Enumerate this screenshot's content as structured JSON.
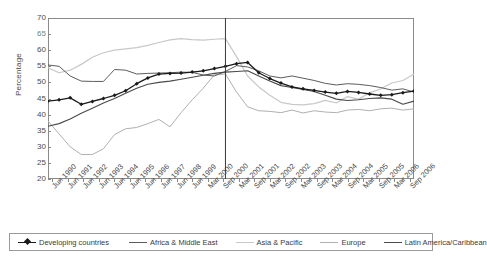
{
  "chart_data": {
    "type": "line",
    "title": "",
    "xlabel": "",
    "ylabel": "Percentage",
    "ylim": [
      20,
      70
    ],
    "ytick_step": 5,
    "yticks": [
      70,
      65,
      60,
      55,
      50,
      45,
      40,
      35,
      30,
      25,
      20
    ],
    "grid": false,
    "legend_position": "bottom",
    "annotations": [
      {
        "type": "vertical-line",
        "at": "Jun 1998",
        "label": ""
      }
    ],
    "categories": [
      "Jun 1990",
      "Dec 1990",
      "Jun 1991",
      "Dec 1991",
      "Jun 1992",
      "Dec 1992",
      "Jun 1993",
      "Dec 1993",
      "Jun 1994",
      "Dec 1994",
      "Jun 1995",
      "Dec 1995",
      "Jun 1996",
      "Dec 1996",
      "Jun 1997",
      "Dec 1997",
      "Jun 1998",
      "Dec 1998",
      "Jun 1999",
      "Sep 1999",
      "Mar 2000",
      "Sep 2000",
      "Mar 2001",
      "Sep 2001",
      "Mar 2002",
      "Sep 2002",
      "Mar 2003",
      "Sep 2003",
      "Mar 2004",
      "Sep 2004",
      "Mar 2005",
      "Sep 2005",
      "Mar 2006",
      "Sep 2006"
    ],
    "xtick_labels": [
      "Jun 1990",
      "Jun 1991",
      "Jun 1992",
      "Jun 1993",
      "Jun 1994",
      "Jun 1995",
      "Jun 1996",
      "Jun 1997",
      "Jun 1998",
      "Jun 1999",
      "Mar 2000",
      "Sep 2000",
      "Mar 2001",
      "Sep 2001",
      "Mar 2002",
      "Sep 2002",
      "Mar 2003",
      "Sep 2003",
      "Mar 2004",
      "Sep 2004",
      "Mar 2005",
      "Sep 2005",
      "Mar 2006",
      "Sep 2006"
    ],
    "series": [
      {
        "name": "Developing countries",
        "color": "#1a1a1a",
        "width": 1.3,
        "marker": "diamond",
        "values": [
          44.2,
          44.6,
          45.2,
          43.2,
          44.1,
          45.0,
          46.0,
          47.4,
          49.6,
          51.4,
          52.6,
          52.8,
          52.9,
          53.2,
          53.6,
          54.3,
          55.0,
          55.8,
          56.2,
          53.0,
          51.2,
          49.8,
          48.6,
          48.0,
          47.5,
          47.0,
          46.6,
          47.2,
          46.9,
          46.4,
          46.0,
          46.2,
          46.8,
          47.3
        ]
      },
      {
        "name": "Africa & Middle East",
        "color": "#5c5c5c",
        "width": 1.0,
        "marker": "none",
        "values": [
          55.4,
          55.0,
          52.0,
          50.4,
          50.3,
          50.3,
          54.0,
          53.8,
          52.6,
          52.8,
          52.9,
          53.0,
          53.2,
          53.1,
          52.3,
          52.0,
          53.4,
          55.2,
          54.8,
          53.6,
          52.0,
          51.4,
          52.0,
          51.3,
          50.6,
          49.7,
          49.2,
          49.6,
          49.4,
          49.0,
          48.4,
          47.6,
          48.0,
          47.0
        ]
      },
      {
        "name": "Asia & Pacific",
        "color": "#c8c8c8",
        "width": 1.2,
        "marker": "none",
        "values": [
          54.5,
          53.0,
          53.8,
          55.6,
          57.8,
          59.2,
          60.0,
          60.4,
          60.8,
          61.5,
          62.4,
          63.2,
          63.6,
          63.3,
          63.1,
          63.4,
          63.6,
          58.0,
          52.0,
          48.6,
          46.0,
          43.8,
          43.2,
          43.0,
          43.4,
          44.4,
          43.6,
          45.6,
          44.8,
          46.8,
          48.0,
          49.8,
          50.6,
          52.6
        ]
      },
      {
        "name": "Europe",
        "color": "#b0b0b0",
        "width": 1.0,
        "marker": "none",
        "values": [
          38.0,
          34.0,
          30.0,
          27.6,
          27.6,
          29.4,
          33.8,
          35.6,
          36.0,
          37.2,
          38.5,
          36.2,
          40.6,
          44.6,
          48.2,
          52.4,
          52.6,
          47.0,
          42.4,
          41.2,
          41.0,
          40.6,
          41.4,
          40.5,
          41.2,
          40.8,
          40.6,
          41.4,
          41.6,
          41.2,
          41.8,
          42.0,
          41.4,
          41.8
        ]
      },
      {
        "name": "Latin America/Caribbean",
        "color": "#4a4a4a",
        "width": 1.1,
        "marker": "none",
        "values": [
          36.4,
          37.2,
          38.6,
          40.4,
          42.0,
          43.6,
          45.0,
          46.6,
          48.2,
          49.4,
          50.0,
          50.4,
          51.0,
          51.6,
          52.2,
          52.8,
          53.2,
          53.4,
          53.6,
          52.0,
          50.4,
          49.0,
          48.4,
          47.8,
          47.2,
          46.0,
          44.8,
          44.4,
          44.6,
          45.0,
          45.2,
          44.8,
          43.2,
          44.2
        ]
      }
    ]
  },
  "legend": {
    "items": [
      {
        "label": "Developing countries",
        "color": "#1a1a1a",
        "marker": "diamond"
      },
      {
        "label": "Africa & Middle East",
        "color": "#5c5c5c",
        "marker": "none"
      },
      {
        "label": "Asia & Pacific",
        "color": "#c8c8c8",
        "marker": "none"
      },
      {
        "label": "Europe",
        "color": "#b0b0b0",
        "marker": "none"
      },
      {
        "label": "Latin America/Caribbean",
        "color": "#4a4a4a",
        "marker": "none"
      }
    ]
  }
}
